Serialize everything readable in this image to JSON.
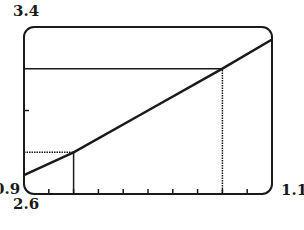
{
  "chart_data": {
    "type": "line",
    "title": "",
    "xlabel": "",
    "ylabel": "",
    "xlim": [
      0.9,
      1.1
    ],
    "ylim": [
      2.6,
      3.4
    ],
    "x_tick_step": 0.02,
    "y_ticks": [
      3.0
    ],
    "grid": false,
    "legend": null,
    "axis_labels": {
      "y_max": "3.4",
      "y_min": "2.6",
      "x_min": "0.9",
      "x_max": "1.1"
    },
    "series": [
      {
        "name": "f(x)",
        "x": [
          0.9,
          0.94,
          1.0,
          1.06,
          1.1
        ],
        "y": [
          2.69,
          2.8,
          3.0,
          3.2,
          3.34
        ]
      }
    ],
    "annotations": [
      {
        "type": "hline",
        "y": 3.2,
        "x_from": 0.9,
        "x_to": 1.06,
        "style": "solid"
      },
      {
        "type": "vline",
        "x": 1.06,
        "y_from": 2.6,
        "y_to": 3.2,
        "style": "dotted"
      },
      {
        "type": "hline",
        "y": 2.8,
        "x_from": 0.9,
        "x_to": 0.94,
        "style": "dotted"
      },
      {
        "type": "vline",
        "x": 0.94,
        "y_from": 2.6,
        "y_to": 2.8,
        "style": "solid"
      }
    ]
  },
  "colors": {
    "ink": "#1a1a1a",
    "background": "#ffffff"
  }
}
